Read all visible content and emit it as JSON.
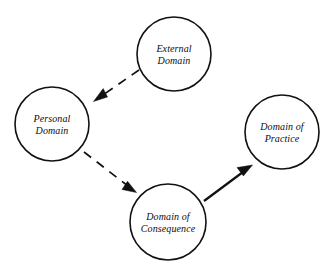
{
  "diagram": {
    "background_color": "#ffffff",
    "stroke_color": "#111111",
    "fill_color": "#ffffff",
    "nodes": [
      {
        "id": "external-domain",
        "label_line1": "External",
        "label_line2": "Domain",
        "cx": 174,
        "cy": 54,
        "r": 37
      },
      {
        "id": "personal-domain",
        "label_line1": "Personal",
        "label_line2": "Domain",
        "cx": 52,
        "cy": 124,
        "r": 37
      },
      {
        "id": "domain-of-practice",
        "label_line1": "Domain of",
        "label_line2": "Practice",
        "cx": 282,
        "cy": 132,
        "r": 37
      },
      {
        "id": "domain-of-consequence",
        "label_line1": "Domain of",
        "label_line2": "Consequence",
        "cx": 168,
        "cy": 222,
        "r": 38
      }
    ],
    "edges": [
      {
        "id": "external-to-personal",
        "from": "external-domain",
        "to": "personal-domain",
        "style": "dashed",
        "path": "M 139 70 L 100 97",
        "head": "93.5 101.5 107.5 97.0 103.2 88.6",
        "arrow_label": "dashed arrow from External Domain to Personal Domain"
      },
      {
        "id": "personal-to-consequence",
        "from": "personal-domain",
        "to": "domain-of-consequence",
        "style": "dashed",
        "path": "M 84 152 L 128 186",
        "head": "136.5 192.5 122.0 189.5 127.5 181.3",
        "arrow_label": "dashed arrow from Personal Domain to Domain of Consequence"
      },
      {
        "id": "consequence-to-practice",
        "from": "domain-of-consequence",
        "to": "domain-of-practice",
        "style": "solid",
        "path": "M 204 201 L 243 172",
        "head": "252.5 165.0 237.0 167.6 243.4 175.9",
        "arrow_label": "solid arrow from Domain of Consequence to Domain of Practice"
      }
    ]
  }
}
